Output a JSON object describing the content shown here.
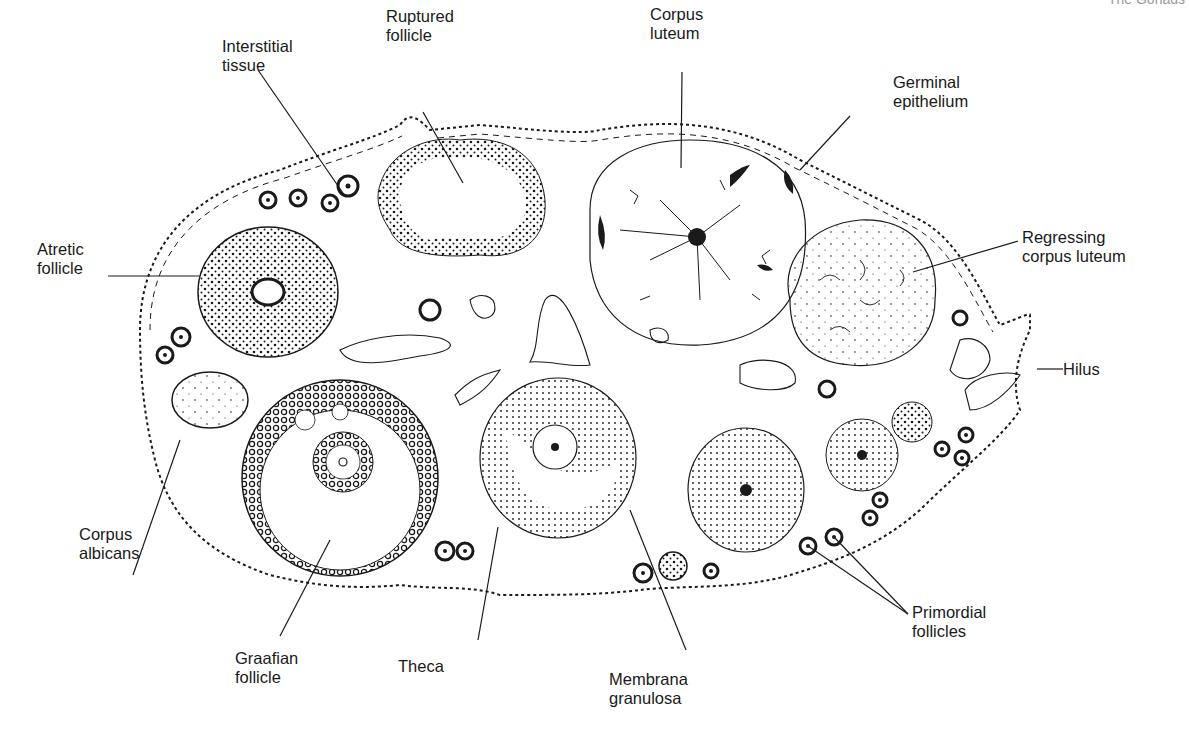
{
  "header": {
    "running_title": "The Gonads"
  },
  "colors": {
    "ink": "#1a1a1a",
    "paper": "#ffffff",
    "faint": "#9a9a9a"
  },
  "figure": {
    "labels": {
      "interstitial_tissue": "Interstitial\ntissue",
      "ruptured_follicle": "Ruptured\nfollicle",
      "corpus_luteum": "Corpus\nluteum",
      "germinal_epithelium": "Germinal\nepithelium",
      "atretic_follicle": "Atretic\nfollicle",
      "regressing_corpus_luteum": "Regressing\ncorpus luteum",
      "hilus": "Hilus",
      "corpus_albicans": "Corpus\nalbicans",
      "graafian_follicle": "Graafian\nfollicle",
      "theca": "Theca",
      "membrana_granulosa": "Membrana\ngranulosa",
      "primordial_follicles": "Primordial\nfollicles"
    }
  }
}
